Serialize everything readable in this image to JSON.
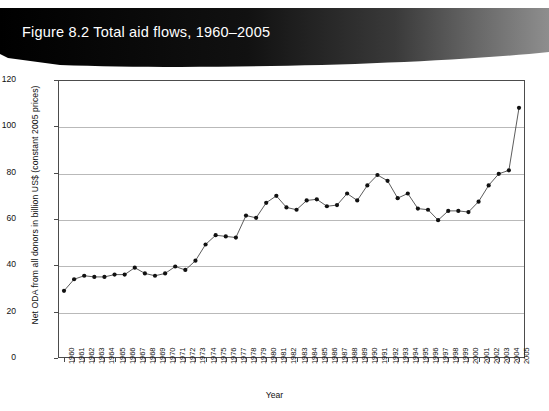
{
  "figure": {
    "banner_title": "Figure 8.2   Total aid flows, 1960–2005"
  },
  "chart_data": {
    "type": "line",
    "title": "Total aid flows, 1960–2005",
    "xlabel": "Year",
    "ylabel": "Net ODA from all donors in billion US$ (constant 2005 prices)",
    "xlim": [
      1960,
      2005
    ],
    "ylim": [
      0,
      120
    ],
    "yticks": [
      0,
      20,
      40,
      60,
      80,
      100,
      120
    ],
    "grid": true,
    "legend": "none",
    "markers": true,
    "line_color": "#4a4a4a",
    "marker_color": "#111111",
    "categories": [
      "1960",
      "1961",
      "1962",
      "1963",
      "1964",
      "1965",
      "1966",
      "1967",
      "1968",
      "1969",
      "1970",
      "1971",
      "1972",
      "1973",
      "1974",
      "1975",
      "1976",
      "1977",
      "1978",
      "1979",
      "1980",
      "1981",
      "1982",
      "1983",
      "1984",
      "1985",
      "1986",
      "1987",
      "1988",
      "1989",
      "1990",
      "1991",
      "1992",
      "1993",
      "1994",
      "1995",
      "1996",
      "1997",
      "1998",
      "1999",
      "2000",
      "2001",
      "2002",
      "2003",
      "2004",
      "2005"
    ],
    "values": [
      29,
      34,
      35.5,
      35,
      35,
      36,
      36,
      39,
      36.5,
      35.5,
      36.5,
      39.5,
      38,
      42,
      49,
      53,
      52.5,
      52,
      61.5,
      60.5,
      67,
      70,
      65,
      64,
      68,
      68.5,
      65.5,
      66,
      71,
      68,
      74.5,
      79,
      76.5,
      69,
      71,
      64.5,
      64,
      59.5,
      63.5,
      63.5,
      63,
      67.5,
      74.5,
      79.5,
      81,
      108
    ]
  }
}
